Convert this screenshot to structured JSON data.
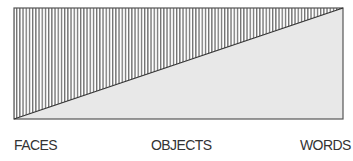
{
  "diagram": {
    "colors": {
      "hatch": "#6e6e6e",
      "fill_light": "#e8e8e8",
      "border": "#555555",
      "diagonal": "#333333"
    }
  },
  "axis_labels": {
    "left": "FACES",
    "middle": "OBJECTS",
    "right": "WORDS"
  }
}
